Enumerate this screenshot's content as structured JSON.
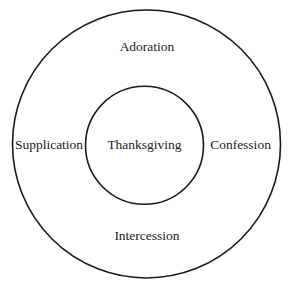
{
  "diagram": {
    "type": "concentric-circles",
    "center_label": "Thanksgiving",
    "outer_labels": {
      "top": "Adoration",
      "right": "Confession",
      "bottom": "Intercession",
      "left": "Supplication"
    },
    "colors": {
      "stroke": "#1a1a1a",
      "background": "#ffffff",
      "text": "#1a1a1a"
    }
  }
}
